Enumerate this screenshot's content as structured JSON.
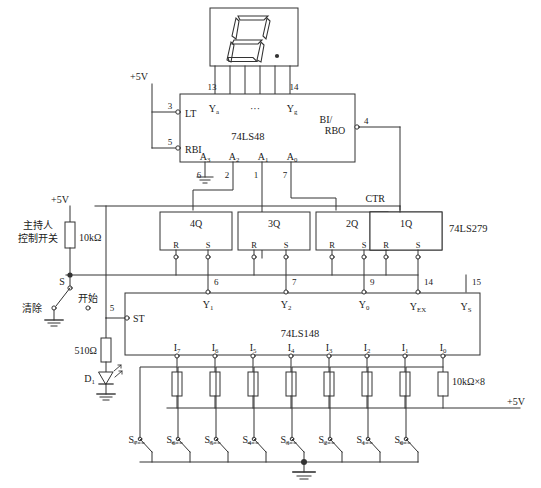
{
  "supplies": {
    "top_label": "+5V",
    "mid_label": "+5V",
    "bottom_right_label": "+5V"
  },
  "display": {
    "name": "seven-segment-display",
    "digit": "8",
    "decimal_point": true,
    "segment_pins": 6
  },
  "decoder": {
    "chip": "74LS48",
    "inputs_top": [
      {
        "label": "Y",
        "sub": "a",
        "pin": "13"
      },
      {
        "label": "···",
        "sub": "",
        "pin": ""
      },
      {
        "label": "Y",
        "sub": "g",
        "pin": "14"
      }
    ],
    "left_pins": [
      {
        "label": "LT",
        "pin": "3"
      },
      {
        "label": "RBI",
        "pin": "5"
      }
    ],
    "right_pins": [
      {
        "label1": "BI/",
        "label2": "RBO",
        "pin": "4"
      }
    ],
    "address_pins": [
      {
        "label": "A",
        "sub": "3",
        "pin": "6",
        "grounded": true
      },
      {
        "label": "A",
        "sub": "2",
        "pin": "2",
        "grounded": false
      },
      {
        "label": "A",
        "sub": "1",
        "pin": "1",
        "grounded": false
      },
      {
        "label": "A",
        "sub": "0",
        "pin": "7",
        "grounded": false
      }
    ]
  },
  "latch": {
    "chip": "74LS279",
    "ctr_label": "CTR",
    "flipflops": [
      {
        "q": "4Q",
        "r": "R",
        "s": "S"
      },
      {
        "q": "3Q",
        "r": "R",
        "s": "S"
      },
      {
        "q": "2Q",
        "r": "R",
        "s": "S"
      },
      {
        "q": "1Q",
        "r": "R",
        "s": "S"
      }
    ]
  },
  "encoder": {
    "chip": "74LS148",
    "strobe": {
      "label": "ST",
      "pin": "5"
    },
    "outputs": [
      {
        "label": "Y",
        "sub": "1",
        "pin": "6"
      },
      {
        "label": "Y",
        "sub": "2",
        "pin": "7"
      },
      {
        "label": "Y",
        "sub": "0",
        "pin": "9"
      },
      {
        "label": "Y",
        "sub": "EX",
        "pin": "14"
      },
      {
        "label": "Y",
        "sub": "S",
        "pin": "15"
      }
    ],
    "inputs": [
      {
        "label": "I",
        "sub": "7"
      },
      {
        "label": "I",
        "sub": "6"
      },
      {
        "label": "I",
        "sub": "5"
      },
      {
        "label": "I",
        "sub": "4"
      },
      {
        "label": "I",
        "sub": "3"
      },
      {
        "label": "I",
        "sub": "2"
      },
      {
        "label": "I",
        "sub": "1"
      },
      {
        "label": "I",
        "sub": "0"
      }
    ]
  },
  "host_control": {
    "caption_line1": "主持人",
    "caption_line2": "控制开关",
    "pullup": "10kΩ",
    "switch_label": "S",
    "position_clear": "清除",
    "position_start": "开始"
  },
  "led_branch": {
    "resistor": "510Ω",
    "diode": "D",
    "diode_sub": "1"
  },
  "switch_bank": {
    "pullup_label": "10kΩ×8",
    "switches": [
      {
        "label": "S",
        "sub": "7"
      },
      {
        "label": "S",
        "sub": "6"
      },
      {
        "label": "S",
        "sub": "5"
      },
      {
        "label": "S",
        "sub": "4"
      },
      {
        "label": "S",
        "sub": "3"
      },
      {
        "label": "S",
        "sub": "2"
      },
      {
        "label": "S",
        "sub": "1"
      },
      {
        "label": "S",
        "sub": "0"
      }
    ]
  },
  "colors": {
    "wire": "#333333",
    "text": "#1a1a1a",
    "background": "#ffffff"
  }
}
